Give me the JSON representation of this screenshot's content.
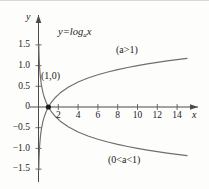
{
  "figure": {
    "equation_label": "y=log",
    "equation_base": "a",
    "equation_var": "x",
    "x_axis_name": "x",
    "y_axis_name": "y",
    "point_label": "(1,0)",
    "upper_curve_label": "(a>1)",
    "lower_curve_label": "(0<a<1)",
    "curve_color": "#6e6e6e",
    "axis_color": "#4a4a4a",
    "text_color": "#1c1c1c",
    "background_color": "#fdfdfb"
  },
  "chart_data": {
    "type": "line",
    "xlabel": "x",
    "ylabel": "y",
    "xlim": [
      -0.6,
      16.4
    ],
    "ylim": [
      -1.75,
      1.75
    ],
    "xticks": [
      2,
      4,
      6,
      8,
      10,
      12,
      14
    ],
    "xtick_labels": [
      "2",
      "4",
      "6",
      "8",
      "10",
      "12",
      "14"
    ],
    "yticks": [
      -1.5,
      -1.0,
      -0.5,
      0,
      0.5,
      1.0,
      1.5
    ],
    "ytick_labels": [
      "−1.5",
      "−1.0",
      "−0.5",
      "0",
      "0.5",
      "1.0",
      "1.5"
    ],
    "grid": false,
    "legend": "annotations",
    "annotations": [
      {
        "text": "y=log_a x",
        "x": 3.6,
        "y": 1.62
      },
      {
        "text": "(a>1)",
        "x": 9.2,
        "y": 1.27
      },
      {
        "text": "(1,0)",
        "x": 0.55,
        "y": 0.52
      },
      {
        "text": "(0<a<1)",
        "x": 8.3,
        "y": -1.45
      }
    ],
    "points": [
      {
        "label": "(1,0)",
        "x": 1,
        "y": 0,
        "marker": "filled-circle"
      }
    ],
    "series": [
      {
        "name": "(a>1)",
        "formula": "y = log_10(x)",
        "x": [
          0.03,
          0.05,
          0.08,
          0.12,
          0.2,
          0.3,
          0.45,
          0.6,
          0.8,
          1.0,
          1.3,
          1.7,
          2.2,
          3.0,
          4.0,
          5.0,
          6.0,
          7.0,
          8.0,
          9.0,
          10.0,
          11.0,
          12.0,
          13.0,
          14.0,
          15.0
        ],
        "y": [
          -1.523,
          -1.301,
          -1.097,
          -0.921,
          -0.699,
          -0.523,
          -0.347,
          -0.222,
          -0.097,
          0.0,
          0.114,
          0.23,
          0.342,
          0.477,
          0.602,
          0.699,
          0.778,
          0.845,
          0.903,
          0.954,
          1.0,
          1.041,
          1.079,
          1.114,
          1.146,
          1.176
        ]
      },
      {
        "name": "(0<a<1)",
        "formula": "y = log_(1/10)(x)",
        "x": [
          0.03,
          0.05,
          0.08,
          0.12,
          0.2,
          0.3,
          0.45,
          0.6,
          0.8,
          1.0,
          1.3,
          1.7,
          2.2,
          3.0,
          4.0,
          5.0,
          6.0,
          7.0,
          8.0,
          9.0,
          10.0,
          11.0,
          12.0,
          13.0,
          14.0,
          15.0
        ],
        "y": [
          1.523,
          1.301,
          1.097,
          0.921,
          0.699,
          0.523,
          0.347,
          0.222,
          0.097,
          0.0,
          -0.114,
          -0.23,
          -0.342,
          -0.477,
          -0.602,
          -0.699,
          -0.778,
          -0.845,
          -0.903,
          -0.954,
          -1.0,
          -1.041,
          -1.079,
          -1.114,
          -1.146,
          -1.176
        ]
      }
    ]
  }
}
